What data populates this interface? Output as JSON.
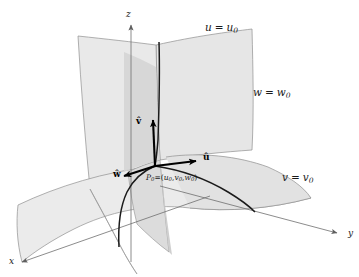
{
  "figure": {
    "type": "3d-coordinate-surface-diagram",
    "background_color": "#ffffff",
    "surface_fill_light": "#e9e9e9",
    "surface_fill_mid": "#dedede",
    "surface_fill_dark": "#cfcfcf",
    "surface_stroke": "#8a8a8a",
    "axis_color": "#6f6f6f",
    "vector_color": "#000000",
    "curve_color": "#1a1a1a"
  },
  "axes": [
    {
      "id": "x",
      "label": "x",
      "label_x": 9,
      "label_y": 264
    },
    {
      "id": "y",
      "label": "y",
      "label_x": 348,
      "label_y": 236
    },
    {
      "id": "z",
      "label": "z",
      "label_x": 126,
      "label_y": 17
    }
  ],
  "surface_labels": [
    {
      "id": "u-surface",
      "variable": "u",
      "equals": "=",
      "value": "u",
      "value_sub": "0",
      "full": "u = u0",
      "x": 205,
      "y": 31
    },
    {
      "id": "w-surface",
      "variable": "w",
      "equals": "=",
      "value": "w",
      "value_sub": "0",
      "full": "w = w0",
      "x": 253,
      "y": 96
    },
    {
      "id": "v-surface",
      "variable": "v",
      "equals": "=",
      "value": "v",
      "value_sub": "0",
      "full": "v = v0",
      "x": 282,
      "y": 181
    }
  ],
  "point": {
    "id": "P0",
    "name": "P",
    "name_sub": "0",
    "equals": "=",
    "open_paren": "(",
    "coord_u": "u",
    "coord_u_sub": "0",
    "comma1": ",",
    "coord_v": "v",
    "coord_v_sub": "0",
    "comma2": ",",
    "coord_w": "w",
    "coord_w_sub": "0",
    "close_paren": ")",
    "full": "P0=(u0,v0,w0)",
    "label_x": 146,
    "label_y": 180,
    "origin_x": 155,
    "origin_y": 166
  },
  "vectors": [
    {
      "id": "u-hat",
      "label": "û",
      "base": "u",
      "x": 203,
      "y": 160
    },
    {
      "id": "v-hat",
      "label": "v̂",
      "base": "v",
      "x": 139,
      "y": 124
    },
    {
      "id": "w-hat",
      "label": "ŵ",
      "base": "w",
      "x": 117,
      "y": 176
    }
  ]
}
